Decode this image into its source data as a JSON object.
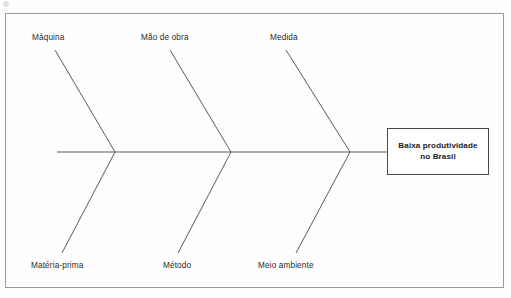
{
  "diagram": {
    "type": "fishbone-ishikawa",
    "orientation": "effect-on-right",
    "frame": {
      "stroke": "#9a9a9a"
    },
    "spine": {
      "stroke": "#5a5a5a",
      "y": 152,
      "x_start": 57,
      "x_end": 387
    },
    "bone_stroke": "#5a5a5a",
    "categories": [
      {
        "id": "maquina",
        "label": "Máquina",
        "position": "top",
        "label_x": 32,
        "label_y": 33,
        "bone": {
          "x1": 55,
          "y1": 50,
          "x2": 115,
          "y2": 152
        }
      },
      {
        "id": "mao-de-obra",
        "label": "Mão de obra",
        "position": "top",
        "label_x": 141,
        "label_y": 33,
        "bone": {
          "x1": 170,
          "y1": 50,
          "x2": 231,
          "y2": 152
        }
      },
      {
        "id": "medida",
        "label": "Medida",
        "position": "top",
        "label_x": 270,
        "label_y": 33,
        "bone": {
          "x1": 286,
          "y1": 50,
          "x2": 350,
          "y2": 152
        }
      },
      {
        "id": "materia-prima",
        "label": "Matéria-prima",
        "position": "bottom",
        "label_x": 31,
        "label_y": 261,
        "bone": {
          "x1": 115,
          "y1": 152,
          "x2": 62,
          "y2": 253
        }
      },
      {
        "id": "metodo",
        "label": "Método",
        "position": "bottom",
        "label_x": 163,
        "label_y": 261,
        "bone": {
          "x1": 231,
          "y1": 152,
          "x2": 178,
          "y2": 253
        }
      },
      {
        "id": "meio-ambiente",
        "label": "Meio ambiente",
        "position": "bottom",
        "label_x": 258,
        "label_y": 261,
        "bone": {
          "x1": 350,
          "y1": 152,
          "x2": 296,
          "y2": 253
        }
      }
    ],
    "effect": {
      "line1": "Baixa produtividade",
      "line2": "no Brasil",
      "text": "Baixa produtividade no Brasil"
    }
  }
}
